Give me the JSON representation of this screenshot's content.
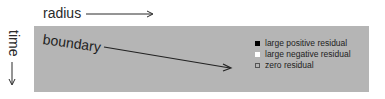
{
  "axes": {
    "x_label": "radius",
    "y_label": "time",
    "x_arrow": "right-arrow",
    "y_arrow": "down-arrow"
  },
  "panel": {
    "background": "#b5b5b5",
    "annotation": "boundary",
    "annotation_arrow": "diagonal-arrow"
  },
  "legend": {
    "items": [
      {
        "label": "large positive residual",
        "marker_color": "#000000",
        "marker_border": "#000000"
      },
      {
        "label": "large negative residual",
        "marker_color": "#ffffff",
        "marker_border": "#ffffff"
      },
      {
        "label": "zero residual",
        "marker_color": "#b5b5b5",
        "marker_border": "#555555"
      }
    ]
  }
}
